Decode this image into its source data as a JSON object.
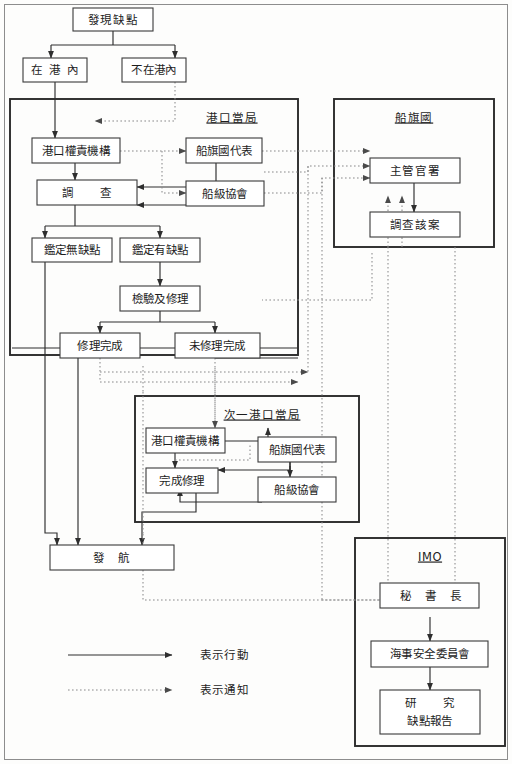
{
  "diagram": {
    "nodes": {
      "defect_found": "發現缺點",
      "in_port": "在 港 內",
      "not_in_port": "不在港內",
      "pa_authority": "港口權責機構",
      "pa_investigate": "調　　查",
      "pa_flag_rep": "船旗國代表",
      "pa_class_society": "船級協會",
      "pa_no_defect": "鑑定無缺點",
      "pa_has_defect": "鑑定有缺點",
      "pa_inspect_repair": "檢驗及修理",
      "pa_repair_done": "修理完成",
      "pa_repair_not_done": "未修理完成",
      "flag_admin": "主管官署",
      "flag_investigate": "調查該案",
      "next_authority": "港口權責機構",
      "next_repair_done": "完成修理",
      "next_flag_rep": "船旗國代表",
      "next_class_society": "船級協會",
      "sailing": "發　航",
      "imo_secretary": "秘　書　長",
      "imo_msc": "海事安全委員會",
      "imo_study_line1": "研　　究",
      "imo_study_line2": "缺點報告"
    },
    "group_titles": {
      "port_authority": "港口當局",
      "flag_state": "船旗國",
      "next_port_authority": "次一港口當局",
      "imo": "IMO"
    },
    "legend": {
      "action_label": "表示行動",
      "notice_label": "表示通知"
    },
    "colors": {
      "line_solid": "#2e2e2e",
      "line_dotted": "#8a8a8a",
      "box_stroke": "#3a3a3a",
      "frame_stroke": "#2b2b2b",
      "background": "#fdfdfc"
    }
  }
}
